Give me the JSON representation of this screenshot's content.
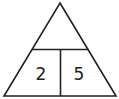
{
  "diagram": {
    "type": "number-bond-triangle",
    "stroke_color": "#222222",
    "background": "#ffffff",
    "top_cell": {
      "value": ""
    },
    "bottom_left_cell": {
      "value": "2"
    },
    "bottom_right_cell": {
      "value": "5"
    }
  }
}
